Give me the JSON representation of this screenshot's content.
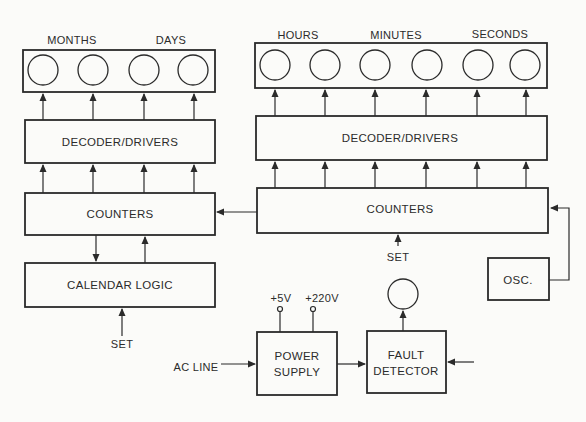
{
  "diagram": {
    "left": {
      "display_labels": [
        "MONTHS",
        "DAYS"
      ],
      "display_count": 4,
      "decoder_label": "DECODER/DRIVERS",
      "counters_label": "COUNTERS",
      "calendar_label": "CALENDAR LOGIC",
      "set_label": "SET"
    },
    "right": {
      "display_labels": [
        "HOURS",
        "MINUTES",
        "SECONDS"
      ],
      "display_count": 6,
      "decoder_label": "DECODER/DRIVERS",
      "counters_label": "COUNTERS",
      "set_label": "SET",
      "osc_label": "OSC."
    },
    "power": {
      "ac_line_label": "AC LINE",
      "supply_label_1": "POWER",
      "supply_label_2": "SUPPLY",
      "v5_label": "+5V",
      "v220_label": "+220V"
    },
    "fault": {
      "label_1": "FAULT",
      "label_2": "DETECTOR"
    },
    "colors": {
      "stroke": "#2a2a2a",
      "background": "#fbfbf9"
    }
  }
}
